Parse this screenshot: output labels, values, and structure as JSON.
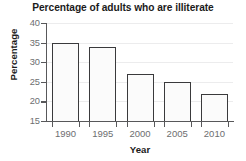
{
  "chart_data": {
    "type": "bar",
    "title": "Percentage of adults who are illiterate",
    "xlabel": "Year",
    "ylabel": "Percentage",
    "categories": [
      "1990",
      "1995",
      "2000",
      "2005",
      "2010"
    ],
    "values": [
      35,
      34,
      27,
      25,
      22
    ],
    "ylim": [
      15,
      40
    ],
    "yticks": [
      15,
      20,
      25,
      30,
      35,
      40
    ],
    "grid": true,
    "legend": null,
    "legend_position": "none",
    "series": [
      {
        "name": "Percentage of adults who are illiterate",
        "values": [
          35,
          34,
          27,
          25,
          22
        ]
      }
    ],
    "colors": {
      "bar_fill": "#fbfbfb",
      "bar_edge": "#3a3a3c",
      "axis": "#58585a",
      "gridline": "#ececed",
      "tick_label": "#6d6e70",
      "title_text": "#1b1b1b",
      "background": "#ffffff"
    }
  }
}
